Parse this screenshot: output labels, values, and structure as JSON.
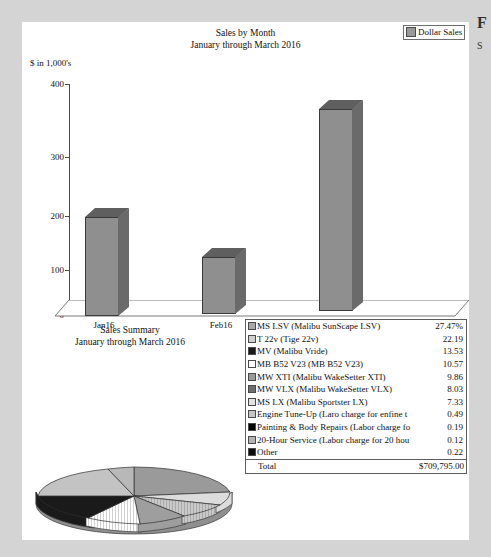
{
  "document": {
    "background_color": "#d4d4d4",
    "page_color": "#ffffff"
  },
  "edge_text": {
    "line1": "F",
    "line2": "S"
  },
  "bar_chart": {
    "title": "Sales by Month",
    "subtitle": "January through March 2016",
    "legend": {
      "label": "Dollar Sales",
      "color": "#9a9a9a"
    },
    "ylabel": "$ in 1,000's",
    "yticks": [
      "400",
      "300",
      "200",
      "100",
      "0"
    ]
  },
  "summary": {
    "title": "Sales Summary",
    "subtitle": "January through March 2016"
  },
  "table": {
    "rows": [
      {
        "swatch": "#a8a8a8",
        "name": "MS LSV (Malibu SunScape LSV)",
        "value": "27.47%"
      },
      {
        "swatch": "#d0d0d0",
        "name": "T 22v (Tige 22v)",
        "value": "22.19"
      },
      {
        "swatch": "#1a1a1a",
        "name": "MV (Malibu Vride)",
        "value": "13.53"
      },
      {
        "swatch": "#ffffff",
        "name": "MB B52 V23 (MB B52 V23)",
        "value": "10.57"
      },
      {
        "swatch": "#9a9a9a",
        "name": "MW XTI (Malibu WakeSetter XTI)",
        "value": "9.86"
      },
      {
        "swatch": "#6e6e6e",
        "name": "MW VLX (Malibu WakeSetter VLX)",
        "value": "8.03"
      },
      {
        "swatch": "#e2e2e2",
        "name": "MS LX (Malibu Sportster LX)",
        "value": "7.33"
      },
      {
        "swatch": "#c6c6c6",
        "name": "Engine Tune-Up (Laro charge for enfine t",
        "value": "0.49"
      },
      {
        "swatch": "#000000",
        "name": "Painting & Body Repairs (Labor charge fo",
        "value": "0.19"
      },
      {
        "swatch": "#b5b5b5",
        "name": "20-Hour Service (Labor charge for 20 hou",
        "value": "0.12"
      },
      {
        "swatch": "#0d0d0d",
        "name": "Other",
        "value": "0.22"
      }
    ],
    "total_label": "Total",
    "total_value": "$709,795.00"
  },
  "chart_data": [
    {
      "type": "bar",
      "title": "Sales by Month",
      "subtitle": "January through March 2016",
      "categories": [
        "Jan16",
        "Feb16",
        "Mar16"
      ],
      "values": [
        200,
        130,
        377
      ],
      "series": [
        {
          "name": "Dollar Sales",
          "values": [
            200,
            130,
            377
          ]
        }
      ],
      "xlabel": "",
      "ylabel": "$ in 1,000's",
      "ylim": [
        0,
        400
      ],
      "yticks": [
        0,
        100,
        200,
        300,
        400
      ],
      "grid": false,
      "legend_position": "top-right",
      "units": "thousands of dollars"
    },
    {
      "type": "pie",
      "title": "Sales Summary",
      "subtitle": "January through March 2016",
      "labels": [
        "MS LSV (Malibu SunScape LSV)",
        "T 22v (Tige 22v)",
        "MV (Malibu Vride)",
        "MB B52 V23 (MB B52 V23)",
        "MW XTI (Malibu WakeSetter XTI)",
        "MW VLX (Malibu WakeSetter VLX)",
        "MS LX (Malibu Sportster LX)",
        "Engine Tune-Up (Laro charge for enfine t",
        "Painting & Body Repairs (Labor charge fo",
        "20-Hour Service (Labor charge for 20 hou",
        "Other"
      ],
      "values": [
        27.47,
        22.19,
        13.53,
        10.57,
        9.86,
        8.03,
        7.33,
        0.49,
        0.19,
        0.12,
        0.22
      ],
      "colors": [
        "#a8a8a8",
        "#d0d0d0",
        "#1a1a1a",
        "#ffffff",
        "#9a9a9a",
        "#6e6e6e",
        "#e2e2e2",
        "#c6c6c6",
        "#000000",
        "#b5b5b5",
        "#0d0d0d"
      ],
      "total": "$709,795.00",
      "legend_position": "right"
    }
  ]
}
